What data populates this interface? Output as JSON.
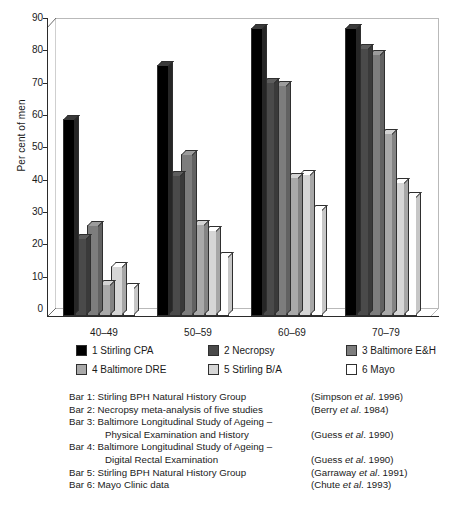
{
  "chart_data": {
    "type": "bar",
    "title": "",
    "xlabel": "",
    "ylabel": "Per cent of men",
    "ylim": [
      0,
      90
    ],
    "ytick_step": 10,
    "yticks": [
      0,
      10,
      20,
      30,
      40,
      50,
      60,
      70,
      80,
      90
    ],
    "grid": false,
    "legend_position": "below-plot",
    "categories": [
      "40–49",
      "50–59",
      "60–69",
      "70–79"
    ],
    "series": [
      {
        "name": "1 Stirling CPA",
        "color": "#000000",
        "values": [
          61,
          77.5,
          89,
          89
        ]
      },
      {
        "name": "2 Necropsy",
        "color": "#4a4a4a",
        "values": [
          24,
          43.5,
          72.5,
          83
        ]
      },
      {
        "name": "3 Baltimore E&H",
        "color": "#7d7d7d",
        "values": [
          28,
          50,
          71.5,
          81
        ]
      },
      {
        "name": "4 Baltimore DRE",
        "color": "#a9a9a9",
        "values": [
          10,
          28.5,
          43,
          56.5
        ]
      },
      {
        "name": "5 Stirling B/A",
        "color": "#d6d6d6",
        "values": [
          15.5,
          26.5,
          44,
          41.5
        ]
      },
      {
        "name": "6 Mayo",
        "color": "#ffffff",
        "values": [
          9,
          18.5,
          33,
          37
        ]
      }
    ]
  },
  "axis": {
    "y_title": "Per cent of men",
    "y_ticks": [
      "0",
      "10",
      "20",
      "30",
      "40",
      "50",
      "60",
      "70",
      "80",
      "90"
    ],
    "x_ticks": [
      "40–49",
      "50–59",
      "60–69",
      "70–79"
    ]
  },
  "legend": {
    "entries": [
      {
        "label": "1 Stirling CPA",
        "color": "#000000"
      },
      {
        "label": "2 Necropsy",
        "color": "#4a4a4a"
      },
      {
        "label": "3 Baltimore E&H",
        "color": "#7d7d7d"
      },
      {
        "label": "4 Baltimore DRE",
        "color": "#a9a9a9"
      },
      {
        "label": "5 Stirling B/A",
        "color": "#d6d6d6"
      },
      {
        "label": "6 Mayo",
        "color": "#ffffff"
      }
    ]
  },
  "caption": {
    "lines": [
      {
        "desc": "Bar 1: Stirling BPH Natural History Group",
        "indent": false,
        "ref_pre": "(Simpson ",
        "ref_ital": "et al",
        "ref_post": ". 1996)"
      },
      {
        "desc": "Bar 2: Necropsy meta-analysis of five studies",
        "indent": false,
        "ref_pre": "(Berry ",
        "ref_ital": "et al",
        "ref_post": ". 1984)"
      },
      {
        "desc": "Bar 3: Baltimore Longitudinal Study of Ageing –",
        "indent": false,
        "ref_pre": "",
        "ref_ital": "",
        "ref_post": ""
      },
      {
        "desc": "Physical Examination and History",
        "indent": true,
        "ref_pre": "(Guess ",
        "ref_ital": "et al",
        "ref_post": ". 1990)"
      },
      {
        "desc": "Bar 4: Baltimore Longitudinal Study of Ageing –",
        "indent": false,
        "ref_pre": "",
        "ref_ital": "",
        "ref_post": ""
      },
      {
        "desc": "Digital Rectal Examination",
        "indent": true,
        "ref_pre": "(Guess ",
        "ref_ital": "et al",
        "ref_post": ". 1990)"
      },
      {
        "desc": "Bar 5: Stirling BPH Natural History Group",
        "indent": false,
        "ref_pre": "(Garraway ",
        "ref_ital": "et al",
        "ref_post": ". 1991)"
      },
      {
        "desc": "Bar 6: Mayo Clinic data",
        "indent": false,
        "ref_pre": "(Chute ",
        "ref_ital": "et al",
        "ref_post": ". 1993)"
      }
    ]
  }
}
